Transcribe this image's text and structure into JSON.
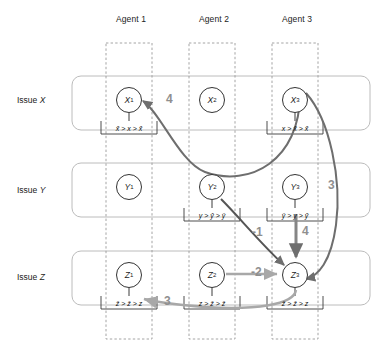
{
  "figure": {
    "type": "diagram",
    "title": "",
    "agents": [
      {
        "id": "a1",
        "label": "Agent 1"
      },
      {
        "id": "a2",
        "label": "Agent 2"
      },
      {
        "id": "a3",
        "label": "Agent 3"
      }
    ],
    "issues": [
      {
        "id": "X",
        "label": "Issue ",
        "symbol": "X"
      },
      {
        "id": "Y",
        "label": "Issue ",
        "symbol": "Y"
      },
      {
        "id": "Z",
        "label": "Issue ",
        "symbol": "Z"
      }
    ],
    "nodes": [
      {
        "id": "x1",
        "letter": "X",
        "index": "1",
        "issue": "X",
        "agent": "a1"
      },
      {
        "id": "x2",
        "letter": "X",
        "index": "2",
        "issue": "X",
        "agent": "a2"
      },
      {
        "id": "x3",
        "letter": "X",
        "index": "3",
        "issue": "X",
        "agent": "a3"
      },
      {
        "id": "y1",
        "letter": "Y",
        "index": "1",
        "issue": "Y",
        "agent": "a1"
      },
      {
        "id": "y2",
        "letter": "Y",
        "index": "2",
        "issue": "Y",
        "agent": "a2"
      },
      {
        "id": "y3",
        "letter": "Y",
        "index": "3",
        "issue": "Y",
        "agent": "a3"
      },
      {
        "id": "z1",
        "letter": "Z",
        "index": "1",
        "issue": "Z",
        "agent": "a1"
      },
      {
        "id": "z2",
        "letter": "Z",
        "index": "2",
        "issue": "Z",
        "agent": "a2"
      },
      {
        "id": "z3",
        "letter": "Z",
        "index": "3",
        "issue": "Z",
        "agent": "a3"
      }
    ],
    "preferences": [
      {
        "id": "pref-x1",
        "node": "x1",
        "text": "x̌ > x > x̂"
      },
      {
        "id": "pref-x3",
        "node": "x3",
        "text": "x > x̂ > x̌"
      },
      {
        "id": "pref-y2",
        "node": "y2",
        "text": "y > y̌ > ŷ"
      },
      {
        "id": "pref-y3",
        "node": "y3",
        "text": "ŷ > y > y̌"
      },
      {
        "id": "pref-z1",
        "node": "z1",
        "text": "ẑ > ž > z"
      },
      {
        "id": "pref-z2",
        "node": "z2",
        "text": "z > ž > ẑ"
      },
      {
        "id": "pref-z3",
        "node": "z3",
        "text": "ž > ẑ > z"
      }
    ],
    "edges": [
      {
        "id": "e-x3-x1",
        "from": "x3",
        "to": "x1",
        "weight": "4"
      },
      {
        "id": "e-y2-z3",
        "from": "y2",
        "to": "z3",
        "weight": "-1"
      },
      {
        "id": "e-y3-z3",
        "from": "y3",
        "to": "z3",
        "weight": "4"
      },
      {
        "id": "e-z2-z3",
        "from": "z2",
        "to": "z3",
        "weight": "-2"
      },
      {
        "id": "e-x3-z3",
        "from": "x3",
        "to": "z3",
        "weight": "3"
      },
      {
        "id": "e-z3-z1",
        "from": "z3",
        "to": "z1",
        "weight": "3"
      }
    ],
    "colors": {
      "node_stroke": "#333333",
      "row_box": "#b9b9b9",
      "column_box": "#9a9a9a",
      "edge_dark": "#6e6e6e",
      "edge_light": "#a8a8a8",
      "text": "#1a1a1a"
    }
  }
}
